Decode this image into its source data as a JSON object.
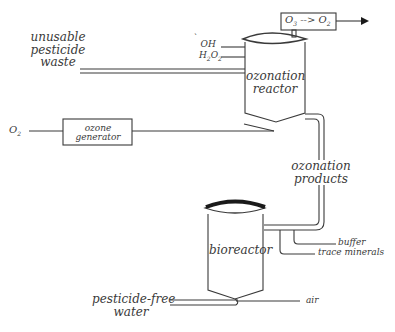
{
  "diagram": {
    "type": "process-flow",
    "nodes": {
      "waste_input": {
        "line1": "unusable",
        "line2": "pesticide",
        "line3": "waste"
      },
      "oh_input": {
        "label": "OH",
        "radical_mark": "`"
      },
      "h2o2_input": {
        "label": "H",
        "sub1": "2",
        "mid": "O",
        "sub2": "2"
      },
      "ozonation_reactor": {
        "line1": "ozonation",
        "line2": "reactor"
      },
      "ozone_destruct": {
        "from": "O",
        "from_sub": "3",
        "arrow": "-->",
        "to": "O",
        "to_sub": "2"
      },
      "o2_input": {
        "label": "O",
        "sub": "2"
      },
      "ozone_generator": {
        "line1": "ozone",
        "line2": "generator"
      },
      "ozonation_products": {
        "line1": "ozonation",
        "line2": "products"
      },
      "bioreactor": {
        "label": "bioreactor"
      },
      "buffer": {
        "label": "buffer"
      },
      "trace_minerals": {
        "label": "trace minerals"
      },
      "output_water": {
        "line1": "pesticide-free",
        "line2": "water"
      },
      "air_input": {
        "label": "air"
      }
    },
    "edges": [
      {
        "from": "unusable pesticide waste",
        "to": "ozonation reactor"
      },
      {
        "from": "OH",
        "to": "ozonation reactor"
      },
      {
        "from": "H2O2",
        "to": "ozonation reactor"
      },
      {
        "from": "O2",
        "to": "ozone generator"
      },
      {
        "from": "ozone generator",
        "to": "ozonation reactor"
      },
      {
        "from": "ozonation reactor",
        "to": "O3 --> O2"
      },
      {
        "from": "O3 --> O2",
        "to": "exhaust"
      },
      {
        "from": "ozonation reactor",
        "to": "bioreactor",
        "label": "ozonation products"
      },
      {
        "from": "buffer",
        "to": "bioreactor"
      },
      {
        "from": "trace minerals",
        "to": "bioreactor"
      },
      {
        "from": "air",
        "to": "bioreactor"
      },
      {
        "from": "bioreactor",
        "to": "pesticide-free water"
      }
    ]
  },
  "colors": {
    "line": "#3a3a3a",
    "text": "#3a3a3a",
    "background": "#ffffff"
  }
}
